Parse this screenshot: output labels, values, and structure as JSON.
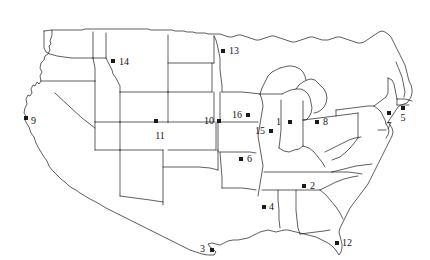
{
  "figure": {
    "name": "united-states-map",
    "width": 430,
    "height": 260,
    "background_color": "#ffffff",
    "outline_color": "#1a1a1a",
    "marker_color": "#1a1a1a",
    "label_color": "#141414",
    "marker_shape": "square",
    "title": ""
  },
  "chart_data": {
    "type": "scatter",
    "title": "",
    "xlabel": "",
    "ylabel": "",
    "basemap": "contiguous-united-states-with-state-boundaries",
    "marker_shape": "square",
    "marker_color": "#1a1a1a",
    "label_count": 16,
    "points": [
      {
        "id": 1,
        "label": "1",
        "x": 290,
        "y": 122,
        "label_x": 281,
        "label_y": 122,
        "label_side": "left",
        "state": "Indiana"
      },
      {
        "id": 2,
        "label": "2",
        "x": 304,
        "y": 186,
        "label_x": 310,
        "label_y": 186,
        "label_side": "right",
        "state": "Georgia"
      },
      {
        "id": 3,
        "label": "3",
        "x": 212,
        "y": 250,
        "label_x": 205,
        "label_y": 249,
        "label_side": "left",
        "state": "Texas"
      },
      {
        "id": 4,
        "label": "4",
        "x": 264,
        "y": 207,
        "label_x": 269,
        "label_y": 207,
        "label_side": "right",
        "state": "Mississippi"
      },
      {
        "id": 5,
        "label": "5",
        "x": 403,
        "y": 108,
        "label_x": 403,
        "label_y": 113,
        "label_side": "below",
        "state": "Rhode Island"
      },
      {
        "id": 6,
        "label": "6",
        "x": 241,
        "y": 159,
        "label_x": 247,
        "label_y": 159,
        "label_side": "right",
        "state": "Arkansas"
      },
      {
        "id": 7,
        "label": "7",
        "x": 389,
        "y": 113,
        "label_x": 389,
        "label_y": 121,
        "label_side": "below",
        "state": "New Jersey"
      },
      {
        "id": 8,
        "label": "8",
        "x": 317,
        "y": 122,
        "label_x": 323,
        "label_y": 122,
        "label_side": "right",
        "state": "Ohio"
      },
      {
        "id": 9,
        "label": "9",
        "x": 26,
        "y": 118,
        "label_x": 31,
        "label_y": 121,
        "label_side": "right",
        "state": "California"
      },
      {
        "id": 10,
        "label": "10",
        "x": 219,
        "y": 121,
        "label_x": 214,
        "label_y": 121,
        "label_side": "left",
        "state": "Nebraska"
      },
      {
        "id": 11,
        "label": "11",
        "x": 156,
        "y": 121,
        "label_x": 160,
        "label_y": 131,
        "label_side": "below",
        "state": "Colorado"
      },
      {
        "id": 12,
        "label": "12",
        "x": 337,
        "y": 243,
        "label_x": 342,
        "label_y": 243,
        "label_side": "right",
        "state": "Florida"
      },
      {
        "id": 13,
        "label": "13",
        "x": 223,
        "y": 51,
        "label_x": 229,
        "label_y": 51,
        "label_side": "right",
        "state": "Minnesota"
      },
      {
        "id": 14,
        "label": "14",
        "x": 113,
        "y": 61,
        "label_x": 119,
        "label_y": 62,
        "label_side": "right",
        "state": "Montana"
      },
      {
        "id": 15,
        "label": "15",
        "x": 271,
        "y": 131,
        "label_x": 265,
        "label_y": 131,
        "label_side": "left",
        "state": "Illinois"
      },
      {
        "id": 16,
        "label": "16",
        "x": 248,
        "y": 115,
        "label_x": 242,
        "label_y": 115,
        "label_side": "left",
        "state": "Iowa"
      }
    ]
  }
}
